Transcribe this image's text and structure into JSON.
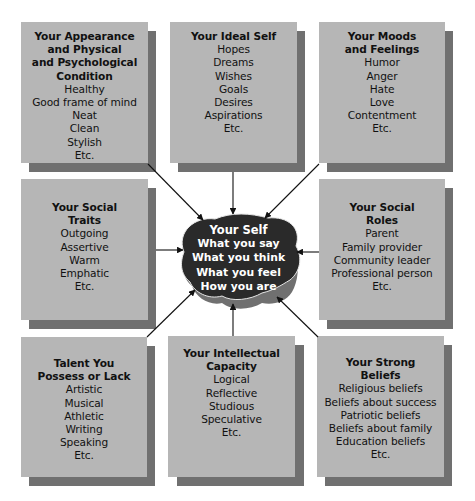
{
  "diagram": {
    "center": {
      "title": "Your Self",
      "items": [
        "What you say",
        "What you think",
        "What you feel",
        "How you are"
      ]
    },
    "boxes": [
      {
        "id": "appearance",
        "title": "Your Appearance\nand Physical\nand Psychological\nCondition",
        "items": [
          "Healthy",
          "Good frame of mind",
          "Neat",
          "Clean",
          "Stylish",
          "Etc."
        ]
      },
      {
        "id": "ideal-self",
        "title": "Your Ideal Self",
        "items": [
          "Hopes",
          "Dreams",
          "Wishes",
          "Goals",
          "Desires",
          "Aspirations",
          "Etc."
        ]
      },
      {
        "id": "moods",
        "title": "Your Moods\nand Feelings",
        "items": [
          "Humor",
          "Anger",
          "Hate",
          "Love",
          "Contentment",
          "Etc."
        ]
      },
      {
        "id": "social-traits",
        "title": "Your Social\nTraits",
        "items": [
          "Outgoing",
          "Assertive",
          "Warm",
          "Emphatic",
          "Etc."
        ]
      },
      {
        "id": "social-roles",
        "title": "Your Social\nRoles",
        "items": [
          "Parent",
          "Family provider",
          "Community leader",
          "Professional person",
          "Etc."
        ]
      },
      {
        "id": "talent",
        "title": "Talent You\nPossess or Lack",
        "items": [
          "Artistic",
          "Musical",
          "Athletic",
          "Writing",
          "Speaking",
          "Etc."
        ]
      },
      {
        "id": "intellect",
        "title": "Your Intellectual\nCapacity",
        "items": [
          "Logical",
          "Reflective",
          "Studious",
          "Speculative",
          "Etc."
        ]
      },
      {
        "id": "beliefs",
        "title": "Your Strong\nBeliefs",
        "items": [
          "Religious beliefs",
          "Beliefs about success",
          "Patriotic beliefs",
          "Beliefs about family",
          "Education beliefs",
          "Etc."
        ]
      }
    ],
    "colors": {
      "box_fill": "#b6b6b6",
      "box_shadow": "#707070",
      "center_fill": "#2a2a2a",
      "center_base": "#707070",
      "text": "#111111",
      "center_text": "#ffffff"
    }
  }
}
